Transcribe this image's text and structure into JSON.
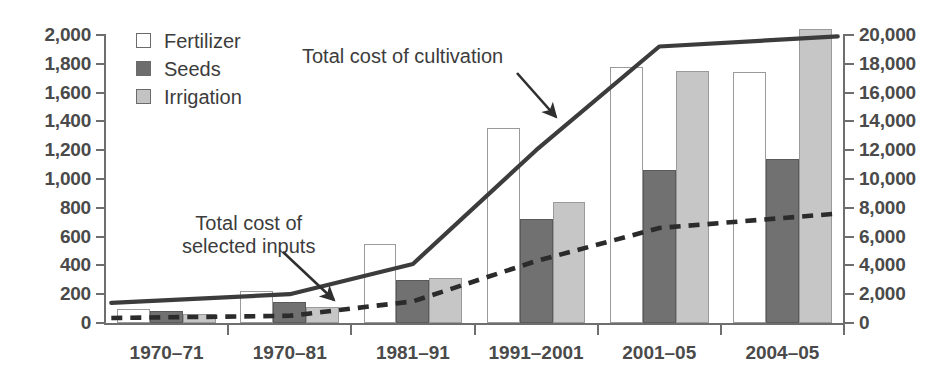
{
  "chart_data": {
    "type": "bar",
    "title": "",
    "xlabel": "",
    "ylabel": "",
    "grid": false,
    "legend_position": "top-left-inside",
    "categories": [
      "1970–71",
      "1970–81",
      "1981–91",
      "1991–2001",
      "2001–05",
      "2004–05"
    ],
    "left_axis": {
      "ylim": [
        0,
        2000
      ],
      "ticks": [
        0,
        200,
        400,
        600,
        800,
        1000,
        1200,
        1400,
        1600,
        1800,
        2000
      ],
      "tick_labels": [
        "0",
        "200",
        "400",
        "600",
        "800",
        "1,000",
        "1,200",
        "1,400",
        "1,600",
        "1,800",
        "2,000"
      ]
    },
    "right_axis": {
      "ylim": [
        0,
        20000
      ],
      "ticks": [
        0,
        2000,
        4000,
        6000,
        8000,
        10000,
        12000,
        14000,
        16000,
        18000,
        20000
      ],
      "tick_labels": [
        "0",
        "2,000",
        "4,000",
        "6,000",
        "8,000",
        "10,000",
        "12,000",
        "14,000",
        "16,000",
        "18,000",
        "20,000"
      ]
    },
    "series": [
      {
        "name": "Fertilizer",
        "axis": "left",
        "kind": "bar",
        "color": "#ffffff",
        "values": [
          100,
          225,
          550,
          1355,
          1780,
          1740
        ]
      },
      {
        "name": "Seeds",
        "axis": "left",
        "kind": "bar",
        "color": "#717171",
        "values": [
          80,
          145,
          300,
          720,
          1060,
          1140
        ]
      },
      {
        "name": "Irrigation",
        "axis": "left",
        "kind": "bar",
        "color": "#c6c6c6",
        "values": [
          65,
          110,
          310,
          840,
          1750,
          2040
        ]
      },
      {
        "name": "Total cost of cultivation",
        "axis": "right",
        "kind": "line",
        "style": "solid",
        "color": "#3c3c3c",
        "values": [
          1400,
          2000,
          4100,
          12000,
          19200,
          19900
        ]
      },
      {
        "name": "Total cost of selected inputs",
        "axis": "right",
        "kind": "line",
        "style": "dashed",
        "color": "#2b2b2b",
        "values": [
          350,
          500,
          1500,
          4300,
          6600,
          7600
        ]
      }
    ],
    "annotations": [
      {
        "id": "cultivation",
        "text": "Total cost of cultivation",
        "points_to": "solid-line"
      },
      {
        "id": "inputs",
        "text": "Total cost of\nselected inputs",
        "points_to": "dashed-line"
      }
    ],
    "legend": [
      {
        "key": "fertilizer",
        "label": "Fertilizer"
      },
      {
        "key": "seeds",
        "label": "Seeds"
      },
      {
        "key": "irrigation",
        "label": "Irrigation"
      }
    ]
  }
}
